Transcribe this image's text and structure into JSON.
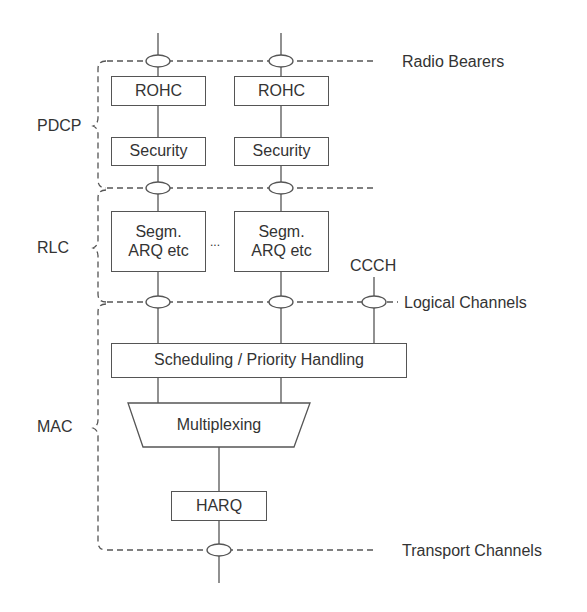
{
  "diagram": {
    "title": "",
    "layers": [
      {
        "id": "pdcp",
        "label": "PDCP"
      },
      {
        "id": "rlc",
        "label": "RLC"
      },
      {
        "id": "mac",
        "label": "MAC"
      }
    ],
    "interfaces": {
      "radio_bearers": "Radio Bearers",
      "logical_channels": "Logical Channels",
      "transport_channels": "Transport Channels"
    },
    "blocks": {
      "rohc_1": "ROHC",
      "rohc_2": "ROHC",
      "security_1": "Security",
      "security_2": "Security",
      "segm_1_line1": "Segm.",
      "segm_1_line2": "ARQ etc",
      "segm_2_line1": "Segm.",
      "segm_2_line2": "ARQ etc",
      "ellipsis": "...",
      "ccch": "CCCH",
      "scheduling": "Scheduling / Priority Handling",
      "multiplexing": "Multiplexing",
      "harq": "HARQ"
    },
    "colors": {
      "line": "#555555",
      "text": "#333333",
      "background": "#ffffff"
    }
  }
}
